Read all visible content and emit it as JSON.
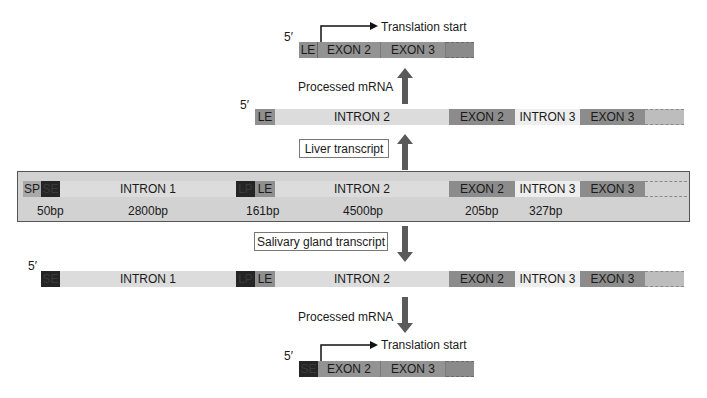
{
  "five_prime": "5′",
  "top_mrna": {
    "translation_label": "Translation start",
    "segments": [
      "LE",
      "EXON 2",
      "EXON 3"
    ]
  },
  "arrow_label_top": "Processed mRNA",
  "liver_transcript": {
    "segments": [
      "LE",
      "INTRON 2",
      "EXON 2",
      "INTRON 3",
      "EXON 3"
    ],
    "label": "Liver transcript"
  },
  "genome": {
    "segments": [
      "SP",
      "SE",
      "INTRON 1",
      "LP",
      "LE",
      "INTRON 2",
      "EXON 2",
      "INTRON 3",
      "EXON 3"
    ],
    "sizes": [
      "50bp",
      "2800bp",
      "161bp",
      "4500bp",
      "205bp",
      "327bp"
    ]
  },
  "salivary_transcript": {
    "label": "Salivary gland transcript",
    "segments": [
      "SE",
      "INTRON 1",
      "LP",
      "LE",
      "INTRON 2",
      "EXON 2",
      "INTRON 3",
      "EXON 3"
    ]
  },
  "arrow_label_bottom": "Processed mRNA",
  "bottom_mrna": {
    "translation_label": "Translation start",
    "segments": [
      "SE",
      "EXON 2",
      "EXON 3"
    ]
  },
  "colors": {
    "exon": "#8c8c8c",
    "intron": "#dcdcdc",
    "promoter_dark": "#252525",
    "arrow": "#5a5a5a"
  }
}
